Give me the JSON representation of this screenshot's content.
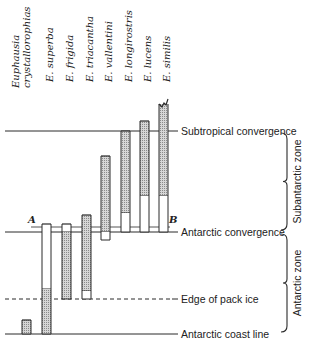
{
  "chart_data": {
    "type": "diagram",
    "title": "",
    "species": [
      {
        "name": "Euphausia crystallorophias",
        "label_lines": [
          "Euphausia",
          "crystallorophias"
        ],
        "x": 22,
        "segments": [
          {
            "from_y": 320,
            "to_y": 334,
            "fill": "dotted"
          }
        ]
      },
      {
        "name": "E. superba",
        "label_lines": [
          "E. superba"
        ],
        "x": 42,
        "segments": [
          {
            "from_y": 224,
            "to_y": 289,
            "fill": "open"
          },
          {
            "from_y": 289,
            "to_y": 334,
            "fill": "dotted"
          }
        ]
      },
      {
        "name": "E. frigida",
        "label_lines": [
          "E. frigida"
        ],
        "x": 62,
        "segments": [
          {
            "from_y": 224,
            "to_y": 232,
            "fill": "open"
          },
          {
            "from_y": 232,
            "to_y": 299,
            "fill": "dotted"
          }
        ]
      },
      {
        "name": "E. triacantha",
        "label_lines": [
          "E. triacantha"
        ],
        "x": 82,
        "segments": [
          {
            "from_y": 215,
            "to_y": 291,
            "fill": "dotted"
          },
          {
            "from_y": 291,
            "to_y": 299,
            "fill": "open"
          }
        ]
      },
      {
        "name": "E. vallentini",
        "label_lines": [
          "E. vallentini"
        ],
        "x": 101,
        "segments": [
          {
            "from_y": 156,
            "to_y": 232,
            "fill": "dotted"
          },
          {
            "from_y": 232,
            "to_y": 240,
            "fill": "open"
          }
        ]
      },
      {
        "name": "E. longirostris",
        "label_lines": [
          "E. longirostris"
        ],
        "x": 121,
        "segments": [
          {
            "from_y": 131,
            "to_y": 213,
            "fill": "dotted"
          },
          {
            "from_y": 213,
            "to_y": 232,
            "fill": "open"
          }
        ]
      },
      {
        "name": "E. lucens",
        "label_lines": [
          "E. lucens"
        ],
        "x": 140,
        "segments": [
          {
            "from_y": 121,
            "to_y": 196,
            "fill": "dotted"
          },
          {
            "from_y": 196,
            "to_y": 232,
            "fill": "open"
          }
        ]
      },
      {
        "name": "E. similis",
        "label_lines": [
          "E. similis"
        ],
        "x": 159,
        "jagged_top": true,
        "segments": [
          {
            "from_y": 104,
            "to_y": 196,
            "fill": "dotted"
          },
          {
            "from_y": 196,
            "to_y": 232,
            "fill": "open"
          }
        ]
      }
    ],
    "reference_lines": [
      {
        "label": "Subtropical convergence",
        "y": 131,
        "style": "solid"
      },
      {
        "label": "Antarctic convergence",
        "y": 232,
        "style": "solid"
      },
      {
        "label": "Edge of pack ice",
        "y": 299,
        "style": "dashed"
      },
      {
        "label": "Antarctic coast line",
        "y": 334,
        "style": "solid"
      }
    ],
    "markers": [
      {
        "label": "A",
        "x": 31,
        "y": 226
      },
      {
        "label": "B",
        "x": 172,
        "y": 226
      }
    ],
    "zones": [
      {
        "label": "Subantarctic zone",
        "from_y": 131,
        "to_y": 232
      },
      {
        "label": "Antarctic zone",
        "from_y": 232,
        "to_y": 334
      }
    ],
    "legend": {
      "dotted": "main range",
      "open": "extended range"
    }
  },
  "colors": {
    "ink": "#2a2a2a",
    "dot_fill": "#bdbdbd",
    "background": "#ffffff"
  }
}
